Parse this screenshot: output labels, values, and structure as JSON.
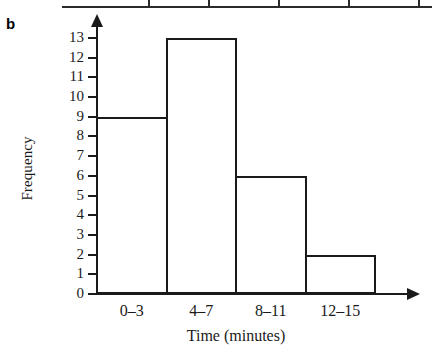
{
  "part_label": "b",
  "table_fragment": {
    "name": "table-bottom-edge",
    "divider_positions": [
      148,
      208,
      278,
      348,
      418
    ]
  },
  "chart_data": {
    "type": "bar",
    "title": "",
    "subtitle": "",
    "categories": [
      "0–3",
      "4–7",
      "8–11",
      "12–15"
    ],
    "values": [
      9,
      13,
      6,
      2
    ],
    "xlabel": "Time (minutes)",
    "ylabel": "Frequency",
    "ylim": [
      0,
      13
    ],
    "ytick_labels": [
      "0",
      "1",
      "2",
      "3",
      "4",
      "5",
      "6",
      "7",
      "8",
      "9",
      "10",
      "11",
      "12",
      "13"
    ],
    "grid": false,
    "legend": null,
    "bar_fill_color": "#ffffff",
    "bar_outline_color": "#1a1a1a",
    "axis_color": "#1a1a1a"
  }
}
